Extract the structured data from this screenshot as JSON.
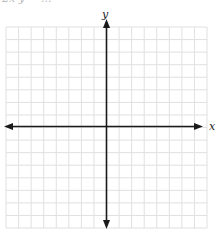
{
  "header": {
    "cut_text": "2x   y = ..."
  },
  "chart_data": {
    "type": "scatter",
    "title": "",
    "xlabel": "x",
    "ylabel": "y",
    "xlim": [
      -8,
      8
    ],
    "ylim": [
      -8,
      8
    ],
    "grid": true,
    "series": [],
    "grid_cells_x": 16,
    "grid_cells_y": 16
  },
  "labels": {
    "x": "x",
    "y": "y"
  },
  "colors": {
    "grid": "#e0e0e0",
    "axis": "#1a1a1a"
  }
}
